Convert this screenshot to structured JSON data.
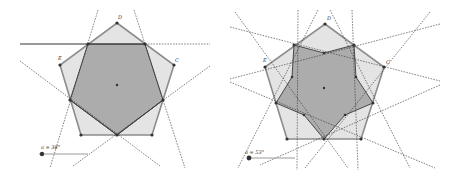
{
  "colors": {
    "outer_fill": "#e4e4e4",
    "outer_stroke": "#8c8c8c",
    "inner_fill": "#a9a9a9",
    "inner_stroke": "#3a3a3a",
    "line": "#333333",
    "point": "#333333",
    "slider_track": "#9a9a9a"
  },
  "panels": [
    {
      "id": "left",
      "slider_label": "a = 38°",
      "vertex_labels": {
        "top": "D",
        "left": "E",
        "right": "C"
      }
    },
    {
      "id": "right",
      "slider_label": "a = 53°",
      "vertex_labels": {
        "top": "D",
        "left": "E",
        "right": "C"
      }
    }
  ]
}
